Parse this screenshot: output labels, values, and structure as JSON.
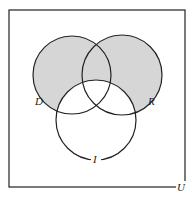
{
  "diagram": {
    "type": "venn",
    "universe_label": "U",
    "sets": [
      {
        "id": "D",
        "label": "D",
        "cx": 72,
        "cy": 75,
        "r": 39
      },
      {
        "id": "R",
        "label": "R",
        "cx": 122,
        "cy": 75,
        "r": 40
      },
      {
        "id": "I",
        "label": "I",
        "cx": 96,
        "cy": 120,
        "r": 40
      }
    ],
    "shaded_region": "(D ∪ R) − I",
    "colors": {
      "shade": "#d6d6d6",
      "stroke": "#222222",
      "background": "#ffffff"
    }
  }
}
